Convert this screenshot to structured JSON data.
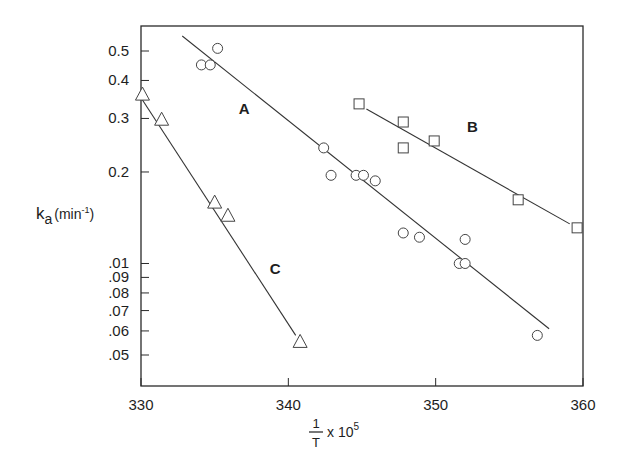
{
  "chart_data": {
    "type": "scatter",
    "title": "",
    "xlabel": "1/T x 10^5",
    "xlabel_parts": {
      "numerator": "1",
      "denominator": "T",
      "multiplier": "x 10",
      "exponent": "5"
    },
    "ylabel": "k_a (min^-1)",
    "ylabel_parts": {
      "main": "k",
      "subscript": "a",
      "unit_open": "(min",
      "unit_exp": "-1",
      "unit_close": ")"
    },
    "xlim": [
      330,
      360
    ],
    "ylim": [
      0.04,
      0.6
    ],
    "yscale": "log",
    "grid": false,
    "legend": "none (series labelled inline A, B, C)",
    "x_ticks": [
      {
        "value": 330,
        "label": "330"
      },
      {
        "value": 340,
        "label": "340"
      },
      {
        "value": 350,
        "label": "350"
      },
      {
        "value": 360,
        "label": "360"
      }
    ],
    "y_ticks": [
      {
        "value": 0.5,
        "label": "0.5"
      },
      {
        "value": 0.4,
        "label": "0.4"
      },
      {
        "value": 0.3,
        "label": "0.3"
      },
      {
        "value": 0.2,
        "label": "0.2"
      },
      {
        "value": 0.1,
        "label": ".01"
      },
      {
        "value": 0.09,
        "label": ".09"
      },
      {
        "value": 0.08,
        "label": ".08"
      },
      {
        "value": 0.07,
        "label": ".07"
      },
      {
        "value": 0.06,
        "label": ".06"
      },
      {
        "value": 0.05,
        "label": ".05"
      }
    ],
    "series": [
      {
        "name": "A",
        "marker": "circle",
        "label_pos": {
          "x": 337.0,
          "y": 0.31
        },
        "points": [
          {
            "x": 334.1,
            "y": 0.45
          },
          {
            "x": 334.7,
            "y": 0.45
          },
          {
            "x": 335.2,
            "y": 0.51
          },
          {
            "x": 342.4,
            "y": 0.24
          },
          {
            "x": 342.9,
            "y": 0.195
          },
          {
            "x": 344.6,
            "y": 0.195
          },
          {
            "x": 345.1,
            "y": 0.195
          },
          {
            "x": 345.9,
            "y": 0.187
          },
          {
            "x": 347.8,
            "y": 0.126
          },
          {
            "x": 348.9,
            "y": 0.122
          },
          {
            "x": 352.0,
            "y": 0.12
          },
          {
            "x": 351.6,
            "y": 0.1
          },
          {
            "x": 352.0,
            "y": 0.1
          },
          {
            "x": 356.9,
            "y": 0.058
          }
        ],
        "fit_line": [
          {
            "x": 332.8,
            "y": 0.56
          },
          {
            "x": 357.7,
            "y": 0.061
          }
        ]
      },
      {
        "name": "B",
        "marker": "square",
        "label_pos": {
          "x": 352.5,
          "y": 0.27
        },
        "points": [
          {
            "x": 344.8,
            "y": 0.335
          },
          {
            "x": 347.8,
            "y": 0.292
          },
          {
            "x": 347.8,
            "y": 0.24
          },
          {
            "x": 349.9,
            "y": 0.253
          },
          {
            "x": 355.6,
            "y": 0.162
          },
          {
            "x": 359.6,
            "y": 0.131
          }
        ],
        "fit_line": [
          {
            "x": 345.3,
            "y": 0.322
          },
          {
            "x": 359.1,
            "y": 0.135
          }
        ]
      },
      {
        "name": "C",
        "marker": "triangle",
        "label_pos": {
          "x": 339.1,
          "y": 0.092
        },
        "points": [
          {
            "x": 330.1,
            "y": 0.358
          },
          {
            "x": 331.4,
            "y": 0.296
          },
          {
            "x": 335.0,
            "y": 0.158
          },
          {
            "x": 335.9,
            "y": 0.143
          },
          {
            "x": 340.8,
            "y": 0.055
          }
        ],
        "fit_line": [
          {
            "x": 330.1,
            "y": 0.345
          },
          {
            "x": 340.5,
            "y": 0.058
          }
        ]
      }
    ]
  }
}
